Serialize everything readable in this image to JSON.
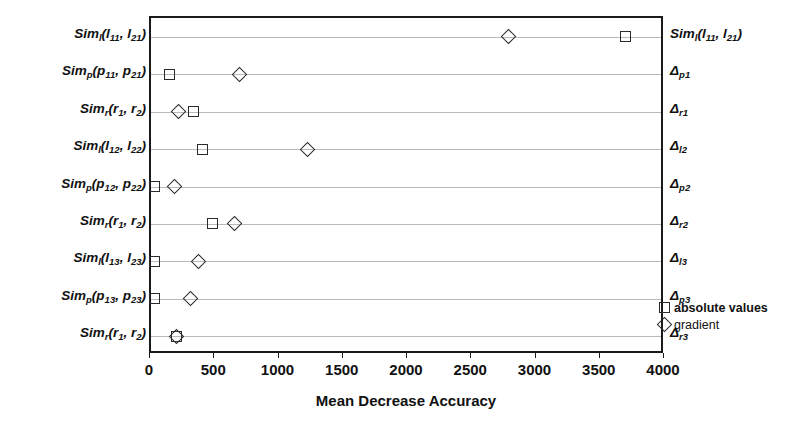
{
  "chart_data": {
    "type": "scatter",
    "title": "",
    "xlabel": "Mean Decrease Accuracy",
    "ylabel": "",
    "xlim": [
      0,
      4000
    ],
    "xticks": [
      0,
      500,
      1000,
      1500,
      2000,
      2500,
      3000,
      3500,
      4000
    ],
    "xticklabels": [
      "0",
      "500",
      "1000",
      "1500",
      "2000",
      "2500",
      "3000",
      "3500",
      "4000"
    ],
    "grid": true,
    "grid_axis": "y",
    "legend_position": "inside-lower-right",
    "legend": [
      {
        "label": "absolute values",
        "marker": "square"
      },
      {
        "label": "gradient",
        "marker": "diamond"
      }
    ],
    "series": [
      {
        "name": "absolute values",
        "marker": "square",
        "values": [
          3690,
          145,
          330,
          400,
          30,
          480,
          25,
          25,
          200
        ]
      },
      {
        "name": "gradient",
        "marker": "diamond",
        "values": [
          2780,
          690,
          215,
          1220,
          185,
          650,
          370,
          310,
          195
        ]
      }
    ],
    "categories": [
      {
        "left_html": "Sim<span class=\"sub\">l</span>(l<span class=\"sub\">11</span>, l<span class=\"sub\">21</span>)",
        "left_text": "Siml(l11, l21)",
        "right_html": "Sim<span class=\"sub\">l</span>(l<span class=\"sub\">11</span>, l<span class=\"sub\">21</span>)",
        "right_text": "Siml(l11, l21)"
      },
      {
        "left_html": "Sim<span class=\"sub\">p</span>(p<span class=\"sub\">11</span>, p<span class=\"sub\">21</span>)",
        "left_text": "Simp(p11, p21)",
        "right_html": "&#916;<span class=\"sub\">p1</span>",
        "right_text": "Δp1"
      },
      {
        "left_html": "Sim<span class=\"sub\">r</span>(r<span class=\"sub\">1</span>, r<span class=\"sub\">2</span>)",
        "left_text": "Simr(r1, r2)",
        "right_html": "&#916;<span class=\"sub\">r1</span>",
        "right_text": "Δr1"
      },
      {
        "left_html": "Sim<span class=\"sub\">l</span>(l<span class=\"sub\">12</span>, l<span class=\"sub\">22</span>)",
        "left_text": "Siml(l12, l22)",
        "right_html": "&#916;<span class=\"sub\">l2</span>",
        "right_text": "Δl2"
      },
      {
        "left_html": "Sim<span class=\"sub\">p</span>(p<span class=\"sub\">12</span>, p<span class=\"sub\">22</span>)",
        "left_text": "Simp(p12, p22)",
        "right_html": "&#916;<span class=\"sub\">p2</span>",
        "right_text": "Δp2"
      },
      {
        "left_html": "Sim<span class=\"sub\">r</span>(r<span class=\"sub\">1</span>, r<span class=\"sub\">2</span>)",
        "left_text": "Simr(r1, r2)",
        "right_html": "&#916;<span class=\"sub\">r2</span>",
        "right_text": "Δr2"
      },
      {
        "left_html": "Sim<span class=\"sub\">l</span>(l<span class=\"sub\">13</span>, l<span class=\"sub\">23</span>)",
        "left_text": "Siml(l13, l23)",
        "right_html": "&#916;<span class=\"sub\">l3</span>",
        "right_text": "Δl3"
      },
      {
        "left_html": "Sim<span class=\"sub\">p</span>(p<span class=\"sub\">13</span>, p<span class=\"sub\">23</span>)",
        "left_text": "Simp(p13, p23)",
        "right_html": "&#916;<span class=\"sub\">p3</span>",
        "right_text": "Δp3"
      },
      {
        "left_html": "Sim<span class=\"sub\">r</span>(r<span class=\"sub\">1</span>, r<span class=\"sub\">2</span>)",
        "left_text": "Simr(r1, r2)",
        "right_html": "&#916;<span class=\"sub\">r3</span>",
        "right_text": "Δr3"
      }
    ],
    "colors": {
      "marker_stroke": "#2b2b2b",
      "axis": "#1a1a1a",
      "gridline": "#b9b9b9",
      "background": "#ffffff",
      "text": "#111111"
    }
  }
}
